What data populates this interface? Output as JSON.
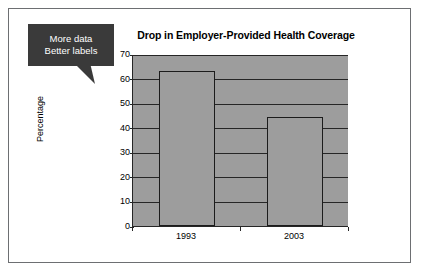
{
  "slide": {
    "background_color": "#ffffff",
    "frame_color": "#6d6f72"
  },
  "callout": {
    "line1": "More data",
    "line2": "Better labels",
    "fill_color": "#3a3a3a",
    "text_color": "#ffffff"
  },
  "chart_data": {
    "type": "bar",
    "title": "Drop in Employer-Provided Health Coverage",
    "xlabel": "",
    "ylabel": "Percentage",
    "categories": [
      "1993",
      "2003"
    ],
    "values": [
      63,
      44.5
    ],
    "ylim": [
      0,
      70
    ],
    "yticks": [
      0,
      10,
      20,
      30,
      40,
      50,
      60,
      70
    ],
    "ytick_labels": [
      "0",
      "10",
      "20",
      "30",
      "40",
      "50",
      "60",
      "70"
    ],
    "grid": true,
    "legend": false,
    "plot_background_color": "#9d9d9d",
    "bar_fill_color": "#9d9d9d",
    "bar_border_color": "#1c1c1c",
    "axis_color": "#262626"
  }
}
